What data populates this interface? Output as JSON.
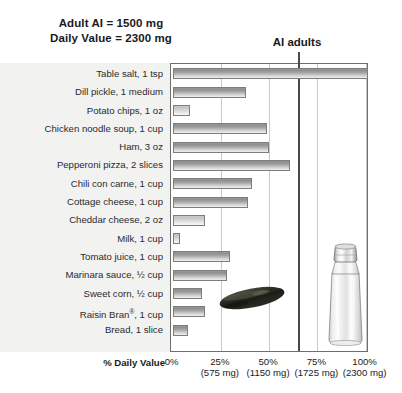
{
  "header": {
    "note_line1": "Adult AI = 1500 mg",
    "note_line2": "Daily Value = 2300 mg",
    "ai_marker_label": "AI adults"
  },
  "axis": {
    "title": "% Daily Value",
    "ticks": [
      {
        "pct": "0%",
        "mg": ""
      },
      {
        "pct": "25%",
        "mg": "(575 mg)"
      },
      {
        "pct": "50%",
        "mg": "(1150 mg)"
      },
      {
        "pct": "75%",
        "mg": "(1725 mg)"
      },
      {
        "pct": "100%",
        "mg": "(2300 mg)"
      }
    ]
  },
  "images": {
    "pickle": "dill-pickle-photo",
    "shaker": "salt-shaker-photo"
  },
  "chart_data": {
    "type": "bar",
    "orientation": "horizontal",
    "title": "",
    "subtitle": "",
    "xlabel": "% Daily Value",
    "ylabel": "",
    "xlim": [
      0,
      102
    ],
    "xticks": [
      0,
      25,
      50,
      75,
      100
    ],
    "xticklabels": [
      "0%",
      "25%",
      "50%",
      "75%",
      "100%"
    ],
    "xtick_sublabels": [
      "",
      "(575 mg)",
      "(1150 mg)",
      "(1725 mg)",
      "(2300 mg)"
    ],
    "grid": true,
    "legend": "none",
    "annotations": [
      {
        "text": "Adult AI = 1500 mg",
        "position": "top-left"
      },
      {
        "text": "Daily Value = 2300 mg",
        "position": "top-left"
      },
      {
        "text": "AI adults",
        "position": "top, at 65.2% reference line"
      }
    ],
    "reference_lines": [
      {
        "label": "AI adults",
        "value": 65.2,
        "mg": 1500
      }
    ],
    "categories": [
      "Table salt, 1 tsp",
      "Dill pickle, 1 medium",
      "Potato chips, 1 oz",
      "Chicken noodle soup, 1 cup",
      "Ham, 3 oz",
      "Pepperoni pizza, 2 slices",
      "Chili con carne, 1 cup",
      "Cottage cheese, 1 cup",
      "Cheddar cheese, 2 oz",
      "Milk, 1 cup",
      "Tomato juice, 1 cup",
      "Marinara sauce, ½ cup",
      "Sweet corn, ½ cup",
      "Raisin Bran®, 1 cup",
      "Bread, 1 slice"
    ],
    "values": [
      101,
      38,
      9,
      49,
      50,
      61,
      41,
      39,
      17,
      4,
      30,
      28,
      15,
      17,
      8
    ],
    "bar_styles": [
      "dark",
      "dark",
      "light",
      "dark",
      "dark",
      "dark",
      "dark",
      "dark",
      "light",
      "light",
      "dark",
      "dark",
      "dark",
      "dark",
      "dark"
    ]
  }
}
